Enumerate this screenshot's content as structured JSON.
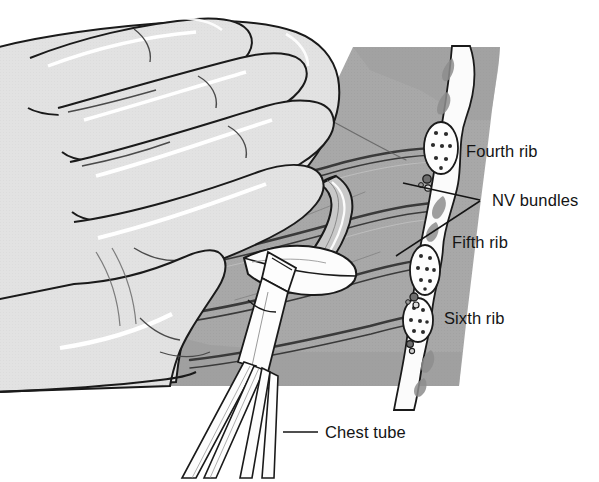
{
  "figure": {
    "background_color": "#ffffff",
    "line_color": "#1a1a1a",
    "colors": {
      "skin_light": "#e2e2e2",
      "skin_highlight": "#ffffff",
      "chest_wall_gray": "#a8a8a8",
      "chest_wall_dark": "#8f8f8f",
      "rib_band_dark": "#3a3a3a",
      "bone_white": "#fbfbfb",
      "marrow_spot": "#2b2b2b",
      "muscle_gray": "#9a9a9a",
      "tube_gray": "#c6c6c6",
      "instrument_white": "#fdfdfd",
      "label_text": "#141414"
    }
  },
  "labels": [
    {
      "id": "fourth-rib",
      "text": "Fourth rib",
      "x": 466,
      "y": 157
    },
    {
      "id": "nv-bundles",
      "text": "NV bundles",
      "x": 492,
      "y": 206
    },
    {
      "id": "fifth-rib",
      "text": "Fifth rib",
      "x": 452,
      "y": 248
    },
    {
      "id": "sixth-rib",
      "text": "Sixth rib",
      "x": 444,
      "y": 324
    },
    {
      "id": "chest-tube",
      "text": "Chest tube",
      "x": 325,
      "y": 438
    }
  ],
  "leader_lines": [
    {
      "id": "nv-upper-leader",
      "from": [
        402,
        182
      ],
      "to": [
        478,
        200
      ]
    },
    {
      "id": "nv-lower-leader",
      "from": [
        398,
        253
      ],
      "to": [
        478,
        200
      ]
    },
    {
      "id": "chest-tube-leader",
      "from": [
        283,
        432
      ],
      "to": [
        318,
        432
      ]
    }
  ],
  "anatomy": {
    "ribs": [
      {
        "id": "fourth-rib-section",
        "name": "Fourth rib",
        "cx": 441,
        "cy": 148,
        "rx": 17,
        "ry": 26,
        "marrow_spots": 8
      },
      {
        "id": "fifth-rib-section",
        "name": "Fifth rib",
        "cx": 425,
        "cy": 270,
        "rx": 15,
        "ry": 25,
        "marrow_spots": 8
      },
      {
        "id": "sixth-rib-section",
        "name": "Sixth rib",
        "cx": 418,
        "cy": 320,
        "rx": 15,
        "ry": 22,
        "marrow_spots": 7
      }
    ],
    "nv_bundles": [
      {
        "id": "nv-bundle-fourth",
        "cx": 428,
        "cy": 180,
        "r": 4
      },
      {
        "id": "nv-bundle-fifth",
        "cx": 414,
        "cy": 298,
        "r": 4
      }
    ],
    "rib_bands_count": 4,
    "hand_fingers_count": 4
  },
  "instruments": {
    "chest_tube": {
      "id": "chest-tube-shape",
      "description": "curved tube entering the incision"
    },
    "clamp": {
      "id": "clamp-shape",
      "description": "Kelly clamp shafts held in the incision"
    },
    "incision": {
      "id": "incision-shape",
      "description": "lens-shaped skin incision over the rib"
    }
  }
}
